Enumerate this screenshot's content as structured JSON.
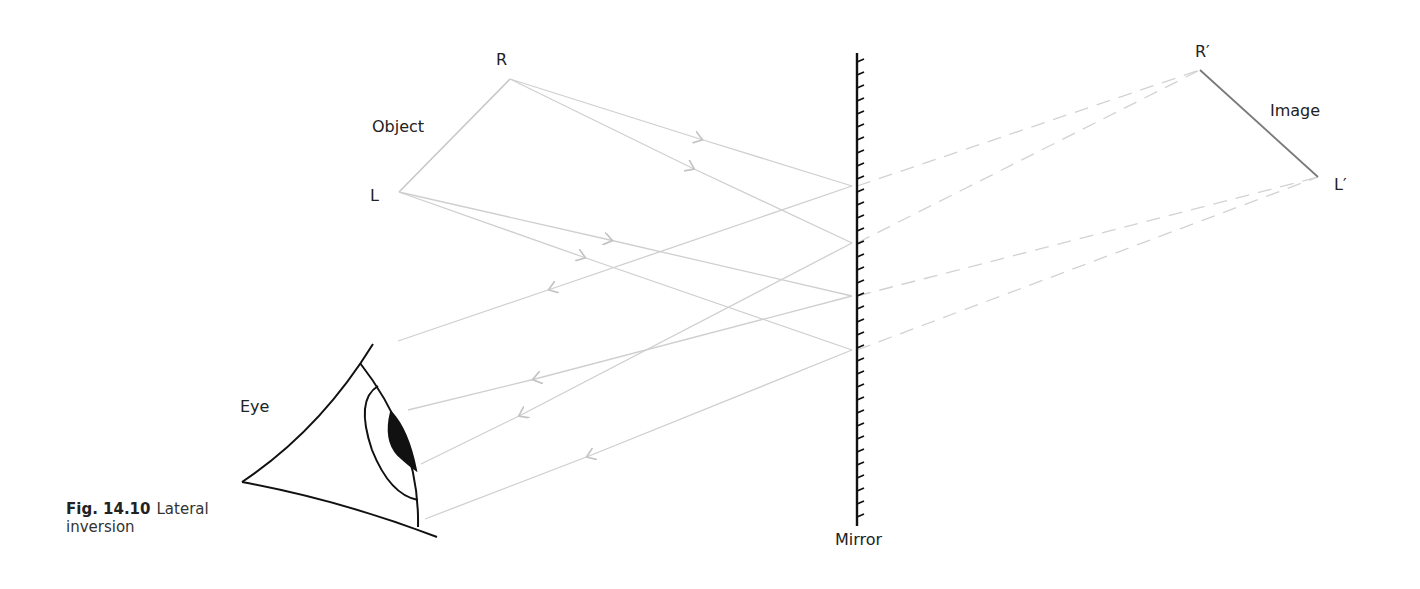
{
  "labels": {
    "object_top": "R",
    "object_bottom": "L",
    "object": "Object",
    "image_top": "R′",
    "image_bottom": "L′",
    "image": "Image",
    "eye": "Eye",
    "mirror": "Mirror"
  },
  "caption": {
    "number": "Fig. 14.10",
    "text_line1": "Lateral",
    "text_line2": "inversion"
  },
  "colors": {
    "ray": "#cfcfcf",
    "object_line": "#c8c8c8",
    "image_line": "#7a7a7a",
    "mirror": "#111111",
    "eye": "#111111"
  },
  "geometry": {
    "object": {
      "R": [
        510,
        79
      ],
      "L": [
        399,
        192
      ]
    },
    "image": {
      "R": [
        1200,
        70
      ],
      "L": [
        1318,
        177
      ]
    },
    "mirror": {
      "x": 857,
      "y_top": 53,
      "y_bottom": 526
    },
    "mirror_points": [
      [
        852,
        186
      ],
      [
        852,
        243
      ],
      [
        852,
        296
      ],
      [
        852,
        350
      ]
    ],
    "reflected_ends": [
      [
        398,
        341
      ],
      [
        421,
        464
      ],
      [
        408,
        410
      ],
      [
        425,
        519
      ]
    ]
  }
}
